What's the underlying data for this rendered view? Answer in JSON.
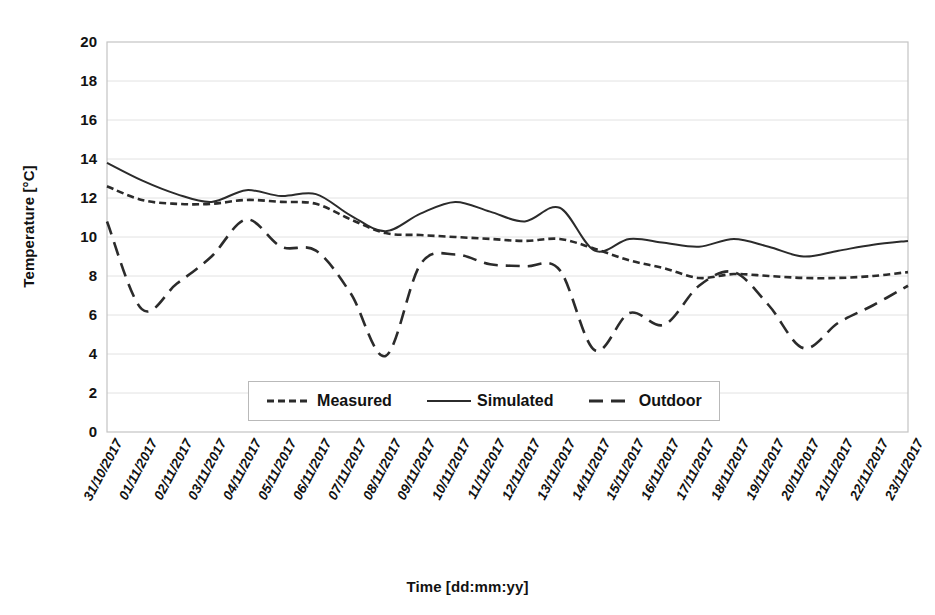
{
  "chart_data": {
    "type": "line",
    "title": "",
    "xlabel": "Time [dd:mm:yy]",
    "ylabel": "Temperature [°C]",
    "ylim": [
      0,
      20
    ],
    "ytick_step": 2,
    "yticks": [
      "20",
      "18",
      "16",
      "14",
      "12",
      "10",
      "8",
      "6",
      "4",
      "2",
      "0"
    ],
    "grid": true,
    "grid_axis": "y",
    "legend_position": "inside-bottom-center",
    "categories": [
      "31/10/2017",
      "01/11/2017",
      "02/11/2017",
      "03/11/2017",
      "04/11/2017",
      "05/11/2017",
      "06/11/2017",
      "07/11/2017",
      "08/11/2017",
      "09/11/2017",
      "10/11/2017",
      "11/11/2017",
      "12/11/2017",
      "13/11/2017",
      "14/11/2017",
      "15/11/2017",
      "16/11/2017",
      "17/11/2017",
      "18/11/2017",
      "19/11/2017",
      "20/11/2017",
      "21/11/2017",
      "22/11/2017",
      "23/11/2017"
    ],
    "series": [
      {
        "name": "Measured",
        "style": "dotted",
        "color": "#2b2b2b",
        "values": [
          12.6,
          11.9,
          11.7,
          11.7,
          11.9,
          11.8,
          11.7,
          10.9,
          10.2,
          10.1,
          10.0,
          9.9,
          9.8,
          9.9,
          9.4,
          8.8,
          8.4,
          7.9,
          8.1,
          8.0,
          7.9,
          7.9,
          8.0,
          8.2
        ]
      },
      {
        "name": "Simulated",
        "style": "solid",
        "color": "#2b2b2b",
        "values": [
          13.8,
          12.9,
          12.2,
          11.8,
          12.4,
          12.1,
          12.2,
          11.1,
          10.3,
          11.2,
          11.8,
          11.3,
          10.8,
          11.5,
          9.3,
          9.9,
          9.7,
          9.5,
          9.9,
          9.5,
          9.0,
          9.3,
          9.6,
          9.8
        ]
      },
      {
        "name": "Outdoor",
        "style": "dashed",
        "color": "#2b2b2b",
        "values": [
          10.8,
          6.3,
          7.6,
          9.0,
          10.9,
          9.5,
          9.3,
          7.1,
          3.9,
          8.6,
          9.1,
          8.6,
          8.5,
          8.3,
          4.2,
          6.1,
          5.5,
          7.5,
          8.2,
          6.5,
          4.3,
          5.6,
          6.5,
          7.5
        ]
      }
    ]
  },
  "legend": {
    "items": [
      {
        "label": "Measured",
        "style": "dotted"
      },
      {
        "label": "Simulated",
        "style": "solid"
      },
      {
        "label": "Outdoor",
        "style": "dashed"
      }
    ]
  }
}
